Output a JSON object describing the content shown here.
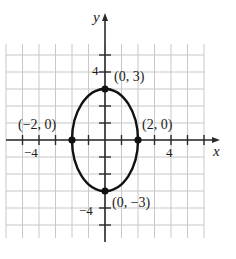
{
  "chart_data": {
    "type": "line",
    "title": "",
    "xlabel": "x",
    "ylabel": "y",
    "xlim": [
      -6,
      6
    ],
    "ylim": [
      -6,
      6
    ],
    "grid": true,
    "x_tick_labels": [
      {
        "value": -4,
        "label": "−4"
      },
      {
        "value": 4,
        "label": "4"
      }
    ],
    "y_tick_labels": [
      {
        "value": 4,
        "label": "4"
      },
      {
        "value": -4,
        "label": "−4"
      }
    ],
    "series": [
      {
        "name": "ellipse",
        "equation": "x^2/4 + y^2/9 = 1",
        "center": [
          0,
          0
        ],
        "semi_axis_x": 2,
        "semi_axis_y": 3
      }
    ],
    "points": [
      {
        "x": 0,
        "y": 3,
        "label": "(0, 3)"
      },
      {
        "x": 2,
        "y": 0,
        "label": "(2, 0)"
      },
      {
        "x": -2,
        "y": 0,
        "label": "(−2, 0)"
      },
      {
        "x": 0,
        "y": -3,
        "label": "(0, −3)"
      }
    ]
  },
  "labels": {
    "x_axis": "x",
    "y_axis": "y",
    "x_tick_neg4": "−4",
    "x_tick_pos4": "4",
    "y_tick_pos4": "4",
    "y_tick_neg4": "−4",
    "pt_top": "(0, 3)",
    "pt_right": "(2, 0)",
    "pt_left": "(−2, 0)",
    "pt_bottom": "(0, −3)"
  },
  "colors": {
    "grid": "#c8c8c8",
    "axis": "#2a2a2a",
    "curve": "#111111"
  }
}
